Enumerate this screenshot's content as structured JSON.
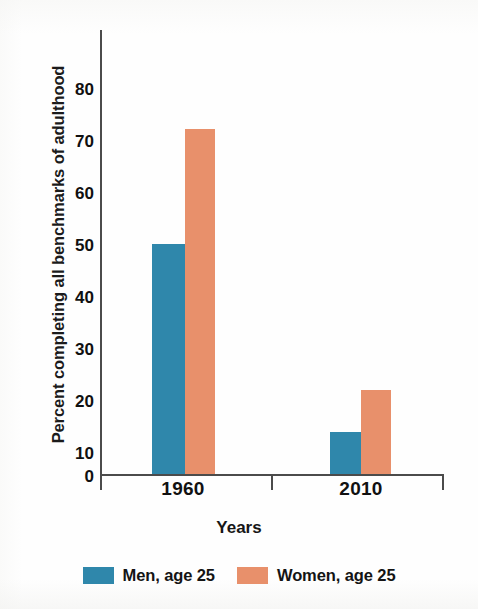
{
  "chart_data": {
    "type": "bar",
    "title": "",
    "subtitle": "",
    "xlabel": "Years",
    "ylabel": "Percent completing all benchmarks of adulthood",
    "categories": [
      "1960",
      "2010"
    ],
    "series": [
      {
        "name": "Men, age 25",
        "color": "#2f87ab",
        "values": [
          44,
          8
        ]
      },
      {
        "name": "Women, age 25",
        "color": "#e8906b",
        "values": [
          66,
          16
        ]
      }
    ],
    "ylim": [
      0,
      85
    ],
    "yticks": [
      0,
      10,
      20,
      30,
      40,
      50,
      60,
      70,
      80
    ],
    "ytick_labels": [
      "0",
      "10",
      "20",
      "30",
      "40",
      "50",
      "60",
      "70",
      "80"
    ],
    "grid": false,
    "legend_position": "bottom",
    "annotations": []
  },
  "axes": {
    "y_axis_title": "Percent completing all benchmarks of adulthood",
    "x_axis_title": "Years",
    "x_category_labels": [
      "1960",
      "2010"
    ]
  },
  "legend": {
    "entries": [
      {
        "label": "Men, age 25",
        "swatch": "men-color-swatch"
      },
      {
        "label": "Women, age 25",
        "swatch": "women-color-swatch"
      }
    ]
  },
  "colors": {
    "men": "#2f87ab",
    "women": "#e8906b",
    "axis": "#4b4b4b",
    "text": "#111111",
    "background": "#ffffff"
  }
}
